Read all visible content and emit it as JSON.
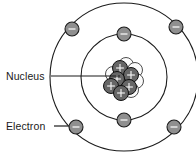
{
  "diagram": {
    "type": "bohr-atom-model",
    "background_color": "#ffffff",
    "width": 196,
    "height": 156,
    "center": {
      "x": 124,
      "y": 77
    },
    "labels": {
      "nucleus": "Nucleus",
      "electron": "Electron"
    },
    "label_positions": {
      "nucleus": {
        "x": 6,
        "y": 80
      },
      "electron": {
        "x": 6,
        "y": 130
      }
    },
    "leader_lines": {
      "nucleus": {
        "x1": 51,
        "y1": 76,
        "x2": 120,
        "y2": 76
      },
      "electron": {
        "x1": 54,
        "y1": 126,
        "x2": 68,
        "y2": 126
      }
    },
    "colors": {
      "shell_stroke": "#1c1c1c",
      "electron_fill": "#8f8f8f",
      "electron_stroke": "#1c1c1c",
      "electron_sign": "#f2f2f2",
      "proton_fill": "#666666",
      "proton_stroke": "#101010",
      "proton_sign": "#f4f4f4",
      "neutron_fill": "#fbfbfb",
      "neutron_stroke": "#3a3a3a",
      "label_text": "#1a1a1a",
      "leader_line": "#1a1a1a"
    },
    "shells": [
      {
        "name": "inner-shell",
        "index": 1,
        "radius": 43,
        "electron_count": 2,
        "electrons": [
          {
            "name": "inner-electron-top",
            "x": 124,
            "y": 34,
            "sign": "minus"
          },
          {
            "name": "inner-electron-bottom",
            "x": 124,
            "y": 120,
            "sign": "minus"
          }
        ]
      },
      {
        "name": "outer-shell",
        "index": 2,
        "radius": 74,
        "electron_count": 4,
        "electrons": [
          {
            "name": "outer-electron-top-left",
            "x": 72,
            "y": 29,
            "sign": "minus"
          },
          {
            "name": "outer-electron-top-right",
            "x": 176,
            "y": 27,
            "sign": "minus"
          },
          {
            "name": "outer-electron-bottom-left",
            "x": 76,
            "y": 127,
            "sign": "minus"
          },
          {
            "name": "outer-electron-bottom-right",
            "x": 174,
            "y": 127,
            "sign": "minus"
          }
        ]
      }
    ],
    "electron_radius": 7,
    "nucleus": {
      "name": "nucleus",
      "particle_radius": 7.5,
      "proton_count": 6,
      "neutron_count": 6,
      "neutrons": [
        {
          "name": "neutron-1",
          "x": 126,
          "y": 65
        },
        {
          "name": "neutron-2",
          "x": 135,
          "y": 70
        },
        {
          "name": "neutron-3",
          "x": 113,
          "y": 74
        },
        {
          "name": "neutron-4",
          "x": 136,
          "y": 81
        },
        {
          "name": "neutron-5",
          "x": 120,
          "y": 87
        },
        {
          "name": "neutron-6",
          "x": 131,
          "y": 90
        }
      ],
      "protons": [
        {
          "name": "proton-1",
          "x": 120,
          "y": 68,
          "sign": "plus"
        },
        {
          "name": "proton-2",
          "x": 131,
          "y": 75,
          "sign": "plus"
        },
        {
          "name": "proton-3",
          "x": 117,
          "y": 79,
          "sign": "plus"
        },
        {
          "name": "proton-4",
          "x": 129,
          "y": 87,
          "sign": "plus"
        },
        {
          "name": "proton-5",
          "x": 111,
          "y": 86,
          "sign": "plus"
        },
        {
          "name": "proton-6",
          "x": 121,
          "y": 93,
          "sign": "plus"
        }
      ]
    }
  }
}
